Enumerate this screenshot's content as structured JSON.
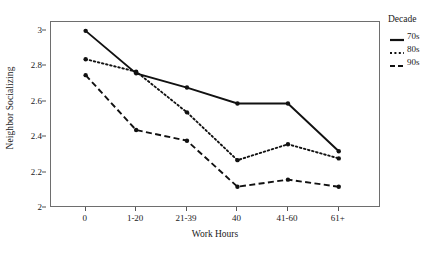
{
  "chart_data": {
    "type": "line",
    "title": "",
    "xlabel": "Work Hours",
    "ylabel": "Neighbor Socializing",
    "categories": [
      "0",
      "1-20",
      "21-39",
      "40",
      "41-60",
      "61+"
    ],
    "ylim": [
      2,
      3.05
    ],
    "yticks": [
      "2",
      "2.2",
      "2.4",
      "2.6",
      "2.8",
      "3"
    ],
    "ytick_values": [
      2,
      2.2,
      2.4,
      2.6,
      2.8,
      3
    ],
    "grid": false,
    "legend_position": "right",
    "legend_title": "Decade",
    "series": [
      {
        "name": "70s",
        "style": "solid",
        "color": "#111111",
        "values": [
          3.0,
          2.76,
          2.68,
          2.59,
          2.59,
          2.32
        ]
      },
      {
        "name": "80s",
        "style": "dotted",
        "color": "#111111",
        "values": [
          2.84,
          2.77,
          2.54,
          2.27,
          2.36,
          2.28
        ]
      },
      {
        "name": "90s",
        "style": "dashed",
        "color": "#111111",
        "values": [
          2.75,
          2.44,
          2.38,
          2.12,
          2.16,
          2.12
        ]
      }
    ]
  },
  "axes": {
    "y_title": "Neighbor Socializing",
    "x_title": "Work Hours"
  },
  "legend": {
    "title": "Decade",
    "items": [
      {
        "label": "70s"
      },
      {
        "label": "80s"
      },
      {
        "label": "90s"
      }
    ]
  }
}
